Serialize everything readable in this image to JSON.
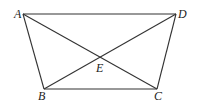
{
  "diagram": {
    "type": "trapezoid-with-diagonals",
    "points": {
      "A": {
        "label": "A",
        "x": 23,
        "y": 14
      },
      "D": {
        "label": "D",
        "x": 176,
        "y": 14
      },
      "B": {
        "label": "B",
        "x": 44,
        "y": 89
      },
      "C": {
        "label": "C",
        "x": 157,
        "y": 89
      },
      "E": {
        "label": "E",
        "x": 100,
        "y": 60
      }
    },
    "segments": [
      "AD",
      "BC",
      "AB",
      "DC",
      "AC",
      "BD"
    ]
  }
}
